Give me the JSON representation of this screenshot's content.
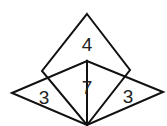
{
  "diagram": {
    "stroke_color": "#111111",
    "labels": {
      "top": "4",
      "center": "7",
      "left": "3",
      "right": "3"
    }
  }
}
